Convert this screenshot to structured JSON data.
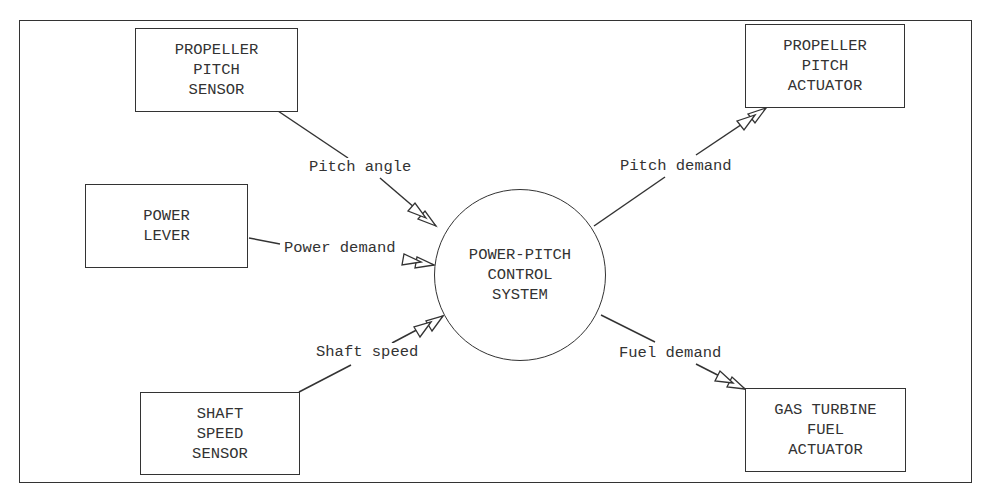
{
  "diagram": {
    "central_node": {
      "lines": [
        "POWER-PITCH",
        "CONTROL",
        "SYSTEM"
      ]
    },
    "nodes": {
      "propeller_pitch_sensor": {
        "lines": [
          "PROPELLER",
          "PITCH",
          "SENSOR"
        ]
      },
      "power_lever": {
        "lines": [
          "POWER",
          "LEVER"
        ]
      },
      "shaft_speed_sensor": {
        "lines": [
          "SHAFT",
          "SPEED",
          "SENSOR"
        ]
      },
      "propeller_pitch_actuator": {
        "lines": [
          "PROPELLER",
          "PITCH",
          "ACTUATOR"
        ]
      },
      "gas_turbine_fuel_actuator": {
        "lines": [
          "GAS TURBINE",
          "FUEL",
          "ACTUATOR"
        ]
      }
    },
    "edges": {
      "pitch_angle": "Pitch angle",
      "power_demand": "Power demand",
      "shaft_speed": "Shaft speed",
      "pitch_demand": "Pitch demand",
      "fuel_demand": "Fuel demand"
    },
    "colors": {
      "stroke": "#333333",
      "background": "#ffffff"
    }
  }
}
